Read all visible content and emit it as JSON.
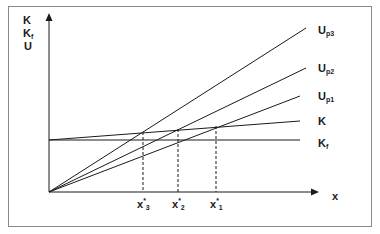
{
  "diagram": {
    "y_axis_labels": [
      "K",
      "K",
      "U"
    ],
    "y_axis_label_subs": [
      "",
      "f",
      ""
    ],
    "x_axis_label": "x",
    "lines": [
      {
        "id": "Up3",
        "label": "U",
        "sub": "p3"
      },
      {
        "id": "Up2",
        "label": "U",
        "sub": "p2"
      },
      {
        "id": "Up1",
        "label": "U",
        "sub": "p1"
      },
      {
        "id": "K",
        "label": "K",
        "sub": ""
      },
      {
        "id": "Kf",
        "label": "K",
        "sub": "f"
      }
    ],
    "intersections": [
      {
        "label": "x",
        "sup": "*",
        "sub": "3"
      },
      {
        "label": "x",
        "sup": "*",
        "sub": "2"
      },
      {
        "label": "x",
        "sup": "*",
        "sub": "1"
      }
    ]
  }
}
